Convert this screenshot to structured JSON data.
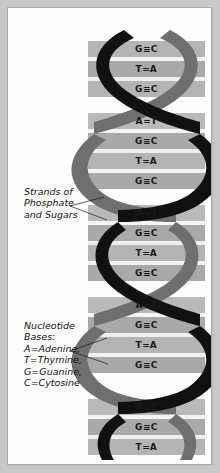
{
  "figure": {
    "background_color": "#c9c9c9",
    "panel_color": "#fdfdfd",
    "border_color": "#a9a9a9"
  },
  "helix": {
    "front_strand_color": "#111111",
    "back_strand_color": "#6f6f6f",
    "rung_colors": [
      "#b4b4b4",
      "#f2f2f2",
      "#a8a8a8",
      "#e2e2e2"
    ],
    "turns": 5,
    "strand_names": [
      "front-strand",
      "back-strand"
    ]
  },
  "base_pairs": [
    {
      "left": "G",
      "bond": "≡",
      "right": "C",
      "y": 41
    },
    {
      "left": "T",
      "bond": "=",
      "right": "A",
      "y": 61
    },
    {
      "left": "G",
      "bond": "≡",
      "right": "C",
      "y": 81
    },
    {
      "left": "A",
      "bond": "=",
      "right": "T",
      "y": 113
    },
    {
      "left": "G",
      "bond": "≡",
      "right": "C",
      "y": 133
    },
    {
      "left": "T",
      "bond": "=",
      "right": "A",
      "y": 153
    },
    {
      "left": "G",
      "bond": "≡",
      "right": "C",
      "y": 173
    },
    {
      "left": "A",
      "bond": "=",
      "right": "T",
      "y": 205
    },
    {
      "left": "G",
      "bond": "≡",
      "right": "C",
      "y": 225
    },
    {
      "left": "T",
      "bond": "=",
      "right": "A",
      "y": 245
    },
    {
      "left": "G",
      "bond": "≡",
      "right": "C",
      "y": 265
    },
    {
      "left": "A",
      "bond": "=",
      "right": "T",
      "y": 297
    },
    {
      "left": "G",
      "bond": "≡",
      "right": "C",
      "y": 317
    },
    {
      "left": "T",
      "bond": "=",
      "right": "A",
      "y": 337
    },
    {
      "left": "G",
      "bond": "≡",
      "right": "C",
      "y": 357
    },
    {
      "left": "A",
      "bond": "=",
      "right": "T",
      "y": 399
    },
    {
      "left": "G",
      "bond": "≡",
      "right": "C",
      "y": 419
    },
    {
      "left": "T",
      "bond": "=",
      "right": "A",
      "y": 439
    }
  ],
  "annotations": {
    "strands": {
      "name": "strands-label",
      "text": "Strands of\nPhosphate\nand Sugars"
    },
    "bases": {
      "name": "bases-label",
      "text": "Nucleotide\nBases:\nA=Adenine,\nT=Thymine,\nG=Guanine,\nC=Cytosine"
    }
  }
}
